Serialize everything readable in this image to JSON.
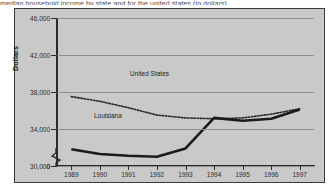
{
  "page": {
    "cutoff_text": "median household income by state and for the united states (in dollars)"
  },
  "chart_data": {
    "type": "line",
    "title": "",
    "xlabel": "",
    "ylabel": "Dollars",
    "x": [
      "1989",
      "1990",
      "1991",
      "1992",
      "1993",
      "1994",
      "1995",
      "1996",
      "1997"
    ],
    "ylim": [
      30000,
      46000
    ],
    "yticks": [
      30000,
      34000,
      38000,
      42000,
      46000
    ],
    "ytick_labels": [
      "30,000",
      "34,000",
      "38,000",
      "42,000",
      "46,000"
    ],
    "y_origin_label": "0",
    "axis_break": true,
    "grid": true,
    "legend_position": "inline-labels",
    "series": [
      {
        "name": "United States",
        "style": "dotted",
        "values": [
          37500,
          37000,
          36300,
          35500,
          35200,
          35100,
          35200,
          35600,
          36200
        ]
      },
      {
        "name": "Louisiana",
        "style": "solid",
        "values": [
          31800,
          31300,
          31100,
          31000,
          31900,
          35200,
          34900,
          35100,
          36100
        ]
      }
    ]
  },
  "axis": {
    "y_title": "Dollars"
  }
}
